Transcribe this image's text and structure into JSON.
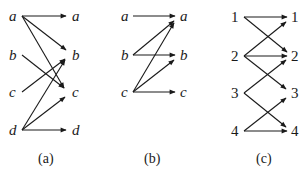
{
  "diagrams": [
    {
      "caption": "(a)",
      "label_style": "italic",
      "nodes": [
        "a",
        "b",
        "c",
        "d"
      ],
      "edges": [
        [
          "a",
          "a"
        ],
        [
          "a",
          "b"
        ],
        [
          "a",
          "c"
        ],
        [
          "b",
          "c"
        ],
        [
          "c",
          "b"
        ],
        [
          "d",
          "b"
        ],
        [
          "d",
          "c"
        ],
        [
          "d",
          "d"
        ]
      ]
    },
    {
      "caption": "(b)",
      "label_style": "italic",
      "nodes": [
        "a",
        "b",
        "c"
      ],
      "edges": [
        [
          "a",
          "a"
        ],
        [
          "b",
          "a"
        ],
        [
          "b",
          "b"
        ],
        [
          "c",
          "a"
        ],
        [
          "c",
          "b"
        ],
        [
          "c",
          "c"
        ]
      ]
    },
    {
      "caption": "(c)",
      "label_style": "upright",
      "nodes": [
        "1",
        "2",
        "3",
        "4"
      ],
      "edges": [
        [
          "1",
          "1"
        ],
        [
          "1",
          "2"
        ],
        [
          "2",
          "1"
        ],
        [
          "2",
          "2"
        ],
        [
          "2",
          "3"
        ],
        [
          "3",
          "2"
        ],
        [
          "3",
          "4"
        ],
        [
          "4",
          "3"
        ],
        [
          "4",
          "4"
        ]
      ]
    }
  ],
  "colors": {
    "ink": "#1a1a1a",
    "background": "#ffffff"
  }
}
